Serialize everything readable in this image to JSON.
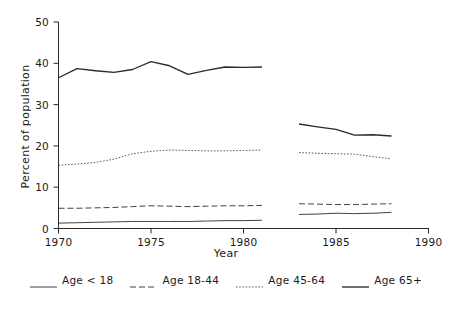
{
  "chart_data": {
    "type": "line",
    "title": "",
    "xlabel": "Year",
    "ylabel": "Percent of population",
    "xlim": [
      1970,
      1990
    ],
    "ylim": [
      0,
      50
    ],
    "xticks": [
      1970,
      1975,
      1980,
      1985,
      1990
    ],
    "xtick_labels": [
      "1970",
      "1975",
      "1980",
      "1985",
      "1990"
    ],
    "yticks": [
      0,
      10,
      20,
      30,
      40,
      50
    ],
    "ytick_labels": [
      "0",
      "10",
      "20",
      "30",
      "40",
      "50"
    ],
    "grid": false,
    "legend_position": "bottom",
    "series": [
      {
        "name": "Age < 18",
        "style": "solid-thin",
        "color": "#2b2b2b",
        "segments": [
          {
            "x": [
              1970,
              1971,
              1972,
              1973,
              1974,
              1975,
              1976,
              1977,
              1978,
              1979,
              1980,
              1981
            ],
            "y": [
              1.3,
              1.4,
              1.5,
              1.6,
              1.7,
              1.7,
              1.7,
              1.7,
              1.8,
              1.9,
              1.9,
              2.0
            ]
          },
          {
            "x": [
              1983,
              1984,
              1985,
              1986,
              1987,
              1988
            ],
            "y": [
              3.4,
              3.5,
              3.7,
              3.6,
              3.7,
              3.9
            ]
          }
        ]
      },
      {
        "name": "Age 18-44",
        "style": "dashed",
        "color": "#2b2b2b",
        "segments": [
          {
            "x": [
              1970,
              1971,
              1972,
              1973,
              1974,
              1975,
              1976,
              1977,
              1978,
              1979,
              1980,
              1981
            ],
            "y": [
              4.9,
              4.9,
              5.0,
              5.1,
              5.3,
              5.5,
              5.4,
              5.3,
              5.4,
              5.5,
              5.5,
              5.6
            ]
          },
          {
            "x": [
              1983,
              1984,
              1985,
              1986,
              1987,
              1988
            ],
            "y": [
              6.0,
              5.9,
              5.8,
              5.8,
              5.9,
              6.0
            ]
          }
        ]
      },
      {
        "name": "Age 45-64",
        "style": "dotted",
        "color": "#4a4a4a",
        "segments": [
          {
            "x": [
              1970,
              1971,
              1972,
              1973,
              1974,
              1975,
              1976,
              1977,
              1978,
              1979,
              1980,
              1981
            ],
            "y": [
              15.3,
              15.6,
              16.0,
              16.8,
              18.1,
              18.7,
              19.0,
              18.9,
              18.8,
              18.8,
              18.9,
              19.0
            ]
          },
          {
            "x": [
              1983,
              1984,
              1985,
              1986,
              1987,
              1988
            ],
            "y": [
              18.4,
              18.2,
              18.1,
              18.0,
              17.4,
              16.9
            ]
          }
        ]
      },
      {
        "name": "Age 65+",
        "style": "solid-thick",
        "color": "#2b2b2b",
        "segments": [
          {
            "x": [
              1970,
              1971,
              1972,
              1973,
              1974,
              1975,
              1976,
              1977,
              1978,
              1979,
              1980,
              1981
            ],
            "y": [
              36.5,
              38.7,
              38.2,
              37.8,
              38.5,
              40.4,
              39.4,
              37.3,
              38.3,
              39.1,
              39.0,
              39.1
            ]
          },
          {
            "x": [
              1983,
              1984,
              1985,
              1986,
              1987,
              1988
            ],
            "y": [
              25.3,
              24.6,
              24.0,
              22.6,
              22.7,
              22.4
            ]
          }
        ]
      }
    ]
  },
  "legend": {
    "items": [
      {
        "label": "Age < 18",
        "style": "solid-thin"
      },
      {
        "label": "Age 18-44",
        "style": "dashed"
      },
      {
        "label": "Age 45-64",
        "style": "dotted"
      },
      {
        "label": "Age 65+",
        "style": "solid-thick"
      }
    ]
  },
  "axes": {
    "ylabel": "Percent of population",
    "xlabel": "Year",
    "ytick_labels": [
      "50",
      "40",
      "30",
      "20",
      "10",
      "0"
    ],
    "xtick_labels": [
      "1970",
      "1975",
      "1980",
      "1985",
      "1990"
    ]
  }
}
